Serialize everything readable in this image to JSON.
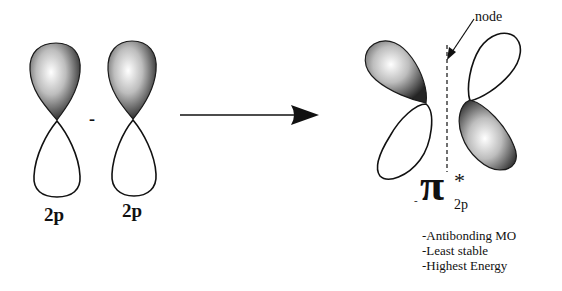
{
  "diagram": {
    "type": "molecular-orbital-formation",
    "left": {
      "orbital_1_label": "2p",
      "operator": "-",
      "orbital_2_label": "2p"
    },
    "arrow": "reaction-arrow",
    "right": {
      "node_label": "node",
      "mo_symbol": "π",
      "mo_superscript": "*",
      "mo_subscript": "2p",
      "mo_prefix": "-",
      "properties": [
        "-Antibonding MO",
        "-Least stable",
        "-Highest Energy"
      ]
    },
    "colors": {
      "line": "#111111",
      "shade_dark": "#2a2a2a",
      "shade_light": "#ffffff",
      "background": "#ffffff"
    }
  }
}
